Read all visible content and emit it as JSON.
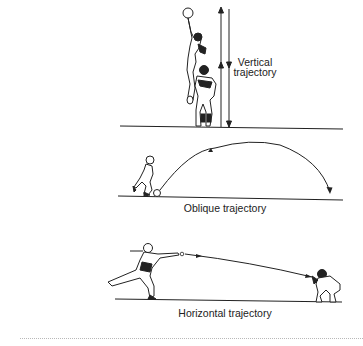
{
  "figure": {
    "panels": [
      {
        "id": "vertical",
        "caption_lines": [
          "Vertical",
          "trajectory"
        ]
      },
      {
        "id": "oblique",
        "caption": "Oblique trajectory"
      },
      {
        "id": "horizontal",
        "caption": "Horizontal trajectory"
      }
    ],
    "colors": {
      "ink": "#222222",
      "background": "#ffffff",
      "divider": "#b8b8b8"
    }
  }
}
